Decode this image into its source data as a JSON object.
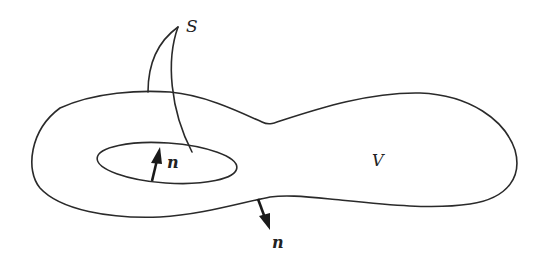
{
  "diagram": {
    "type": "region-with-boundary",
    "labels": {
      "surface": "S",
      "volume": "V",
      "normal_inner": "n",
      "normal_outer": "n"
    },
    "elements": [
      {
        "id": "outer-boundary",
        "kind": "closed-curve",
        "description": "peanut-shaped outer surface"
      },
      {
        "id": "inner-boundary",
        "kind": "ellipse",
        "description": "inner hole surface"
      },
      {
        "id": "normal-inner",
        "kind": "arrow",
        "direction": "up, pointing into the hole"
      },
      {
        "id": "normal-outer",
        "kind": "arrow",
        "direction": "down, pointing outward"
      },
      {
        "id": "leader-lines",
        "kind": "lines",
        "description": "two leaders from S to outer and inner boundaries"
      }
    ],
    "colors": {
      "stroke": "#2a2a2a",
      "background": "#ffffff"
    }
  }
}
